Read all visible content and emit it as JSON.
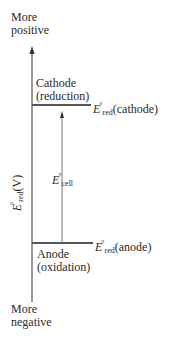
{
  "diagram": {
    "axis": {
      "top_label_line1": "More",
      "top_label_line2": "positive",
      "bottom_label_line1": "More",
      "bottom_label_line2": "negative",
      "axis_title_symbol": "E",
      "axis_title_degree": "°",
      "axis_title_sub": "red",
      "axis_title_unit": "(V)"
    },
    "cathode": {
      "label_line1": "Cathode",
      "label_line2": "(reduction)",
      "level_symbol": "E",
      "level_degree": "°",
      "level_sub": "red",
      "level_paren": "(cathode)"
    },
    "anode": {
      "label_line1": "Anode",
      "label_line2": "(oxidation)",
      "level_symbol": "E",
      "level_degree": "°",
      "level_sub": "red",
      "level_paren": "(anode)"
    },
    "cell": {
      "symbol": "E",
      "degree": "°",
      "sub": "cell"
    },
    "colors": {
      "axis": "#555555",
      "level_lines": "#555555",
      "text": "#2a2a2a"
    }
  }
}
